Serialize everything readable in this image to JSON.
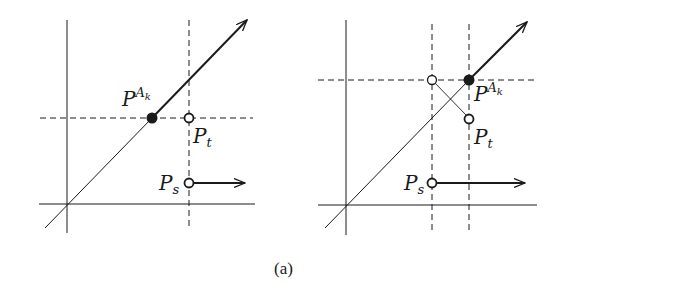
{
  "figure": {
    "caption": "(a)",
    "panels": [
      {
        "id": "left",
        "labels": {
          "pak_main": "P",
          "pak_sup": "A",
          "pak_subsup": "k",
          "pt_main": "P",
          "pt_sub": "t",
          "ps_main": "P",
          "ps_sub": "s"
        },
        "points": {
          "P_Ak": {
            "type": "filled",
            "x": 152,
            "y": 118
          },
          "P_t": {
            "type": "open",
            "x": 189,
            "y": 118
          },
          "P_s": {
            "type": "open",
            "x": 189,
            "y": 183
          }
        }
      },
      {
        "id": "right",
        "labels": {
          "pak_main": "P",
          "pak_sup": "A",
          "pak_subsup": "k",
          "pt_main": "P",
          "pt_sub": "t",
          "ps_main": "P",
          "ps_sub": "s"
        },
        "points": {
          "P_Ak": {
            "type": "filled",
            "x": 469,
            "y": 80
          },
          "P_prev": {
            "type": "open",
            "x": 432,
            "y": 80
          },
          "P_t": {
            "type": "open",
            "x": 469,
            "y": 119
          },
          "P_s": {
            "type": "open",
            "x": 432,
            "y": 183
          }
        }
      }
    ]
  }
}
